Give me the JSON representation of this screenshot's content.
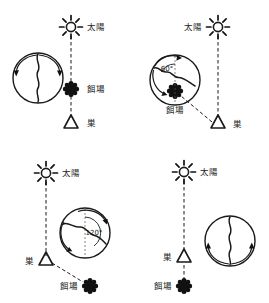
{
  "figure": {
    "type": "diagram",
    "colors": {
      "ink": "#1a1a1a",
      "paper": "#ffffff",
      "guide": "#555555"
    },
    "glyph_names": {
      "sun": "sun-starburst-icon",
      "food": "food-source-flower-icon",
      "nest": "nest-triangle-icon",
      "comb": "honeycomb-dance-circle",
      "waggle": "waggle-run-wavy-line",
      "loop_arrow": "dance-loop-arrow"
    },
    "labels": {
      "sun": "太陽",
      "food": "餌場",
      "nest": "巣"
    },
    "panels": [
      {
        "id": "top-left",
        "name": "panel-food-toward-sun",
        "sun_label": "太陽",
        "food_label": "餌場",
        "nest_label": "巣",
        "angle_label": "",
        "label_side": "right",
        "waggle_direction": "up",
        "description": "food in line with sun, dance runs straight up"
      },
      {
        "id": "top-right",
        "name": "panel-food-60-degrees",
        "sun_label": "太陽",
        "food_label": "餌場",
        "nest_label": "巣",
        "angle_label": "60°",
        "label_side": "left",
        "waggle_direction": "upper-left-60",
        "description": "food 60 degrees left of sun, dance angled 60 degrees"
      },
      {
        "id": "bottom-left",
        "name": "panel-food-120-degrees",
        "sun_label": "太陽",
        "food_label": "餌場",
        "nest_label": "巣",
        "angle_label": "120°",
        "label_side": "right",
        "waggle_direction": "lower-right-120",
        "description": "food 120 degrees right of sun, dance angled 120 degrees"
      },
      {
        "id": "bottom-right",
        "name": "panel-food-away-from-sun",
        "sun_label": "太陽",
        "food_label": "餌場",
        "nest_label": "巣",
        "angle_label": "",
        "label_side": "left",
        "waggle_direction": "down",
        "description": "food opposite the sun, dance runs straight down"
      }
    ]
  }
}
